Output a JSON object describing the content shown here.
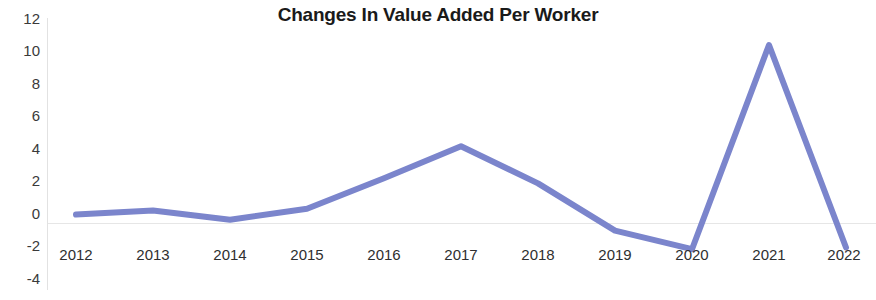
{
  "chart_data": {
    "type": "line",
    "title": "Changes In Value Added Per Worker",
    "xlabel": "",
    "ylabel": "",
    "categories": [
      "2012",
      "2013",
      "2014",
      "2015",
      "2016",
      "2017",
      "2018",
      "2019",
      "2020",
      "2021",
      "2022"
    ],
    "values": [
      0.35,
      0.6,
      0.05,
      0.7,
      2.5,
      4.4,
      2.2,
      -0.6,
      -1.7,
      10.4,
      -1.6
    ],
    "series": [
      {
        "name": "Changes In Value Added Per Worker",
        "values": [
          0.35,
          0.6,
          0.05,
          0.7,
          2.5,
          4.4,
          2.2,
          -0.6,
          -1.7,
          10.4,
          -1.6
        ]
      }
    ],
    "ylim": [
      -4,
      12
    ],
    "ytick_labels": [
      "12",
      "10",
      "8",
      "6",
      "4",
      "2",
      "0",
      "-2",
      "-4"
    ],
    "ytick_values": [
      12,
      10,
      8,
      6,
      4,
      2,
      0,
      -2,
      -4
    ],
    "xtick_labels": [
      "2012",
      "2013",
      "2014",
      "2015",
      "2016",
      "2017",
      "2018",
      "2019",
      "2020",
      "2021",
      "2022"
    ],
    "grid": "zero-line-only",
    "legend": "none",
    "line_color": "#7b85cc",
    "line_width": 6,
    "axis_color": "#e2e2e2",
    "text_color": "#2f2f2f",
    "title_color": "#1a1a1a",
    "background": "#ffffff"
  },
  "title": {
    "text": "Changes In Value Added Per Worker"
  }
}
